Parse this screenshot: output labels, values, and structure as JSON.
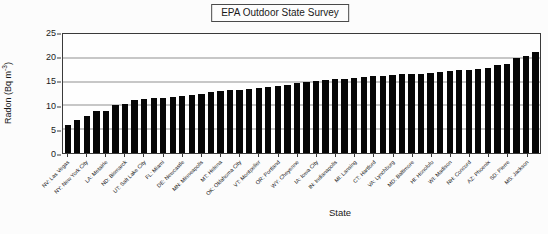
{
  "figure": {
    "title": "EPA Outdoor State Survey",
    "xlabel": "State",
    "ylabel_prefix": "Radon (Bq m",
    "ylabel_sup": "-3",
    "ylabel_suffix": ")"
  },
  "chart_data": {
    "type": "bar",
    "title": "EPA Outdoor State Survey",
    "xlabel": "State",
    "ylabel": "Radon (Bq m⁻³)",
    "ylim": [
      0,
      25
    ],
    "yticks": [
      0,
      5,
      10,
      15,
      20,
      25
    ],
    "grid": true,
    "bar_color": "#060606",
    "n_bars": 50,
    "label_step": 2,
    "label_offset": 0,
    "x_tick_labels": [
      "NV: Las Vegas",
      "NY: New York City",
      "LA: Metairie",
      "ND: Bismarck",
      "UT: Salt Lake City",
      "FL: Miami",
      "DE: Newcastle",
      "MN: Minneapolis",
      "MT: Helena",
      "OK: Oklahoma City",
      "VT: Montpelier",
      "OR: Portland",
      "WY: Cheyenne",
      "IA: Iowa City",
      "IN: Indianapolis",
      "MI: Lansing",
      "CT: Hartford",
      "VA: Lynchburg",
      "MD: Baltimore",
      "HI: Honolulu",
      "WI: Madison",
      "NH: Concord",
      "AZ: Phoenix",
      "SD: Pierre",
      "MS: Jackson"
    ],
    "values": [
      5.9,
      6.9,
      7.8,
      8.8,
      8.9,
      10.1,
      10.2,
      11.2,
      11.4,
      11.5,
      11.6,
      11.8,
      11.9,
      12.1,
      12.4,
      12.8,
      13.0,
      13.2,
      13.3,
      13.5,
      13.7,
      13.9,
      14.1,
      14.3,
      14.8,
      15.0,
      15.1,
      15.3,
      15.5,
      15.6,
      15.8,
      16.0,
      16.1,
      16.2,
      16.4,
      16.5,
      16.6,
      16.7,
      16.9,
      17.1,
      17.3,
      17.4,
      17.5,
      17.7,
      17.9,
      18.4,
      18.6,
      19.9,
      20.3,
      21.2
    ]
  }
}
